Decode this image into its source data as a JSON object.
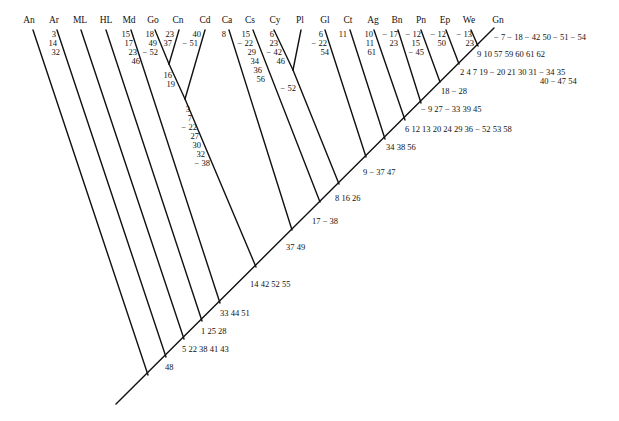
{
  "taxa": [
    {
      "label": "An",
      "x": 33
    },
    {
      "label": "Ar",
      "x": 57
    },
    {
      "label": "ML",
      "x": 81
    },
    {
      "label": "HL",
      "x": 106
    },
    {
      "label": "Md",
      "x": 131
    },
    {
      "label": "Go",
      "x": 155
    },
    {
      "label": "Cn",
      "x": 179
    },
    {
      "label": "Cd",
      "x": 205
    },
    {
      "label": "Ca",
      "x": 229
    },
    {
      "label": "Cs",
      "x": 253
    },
    {
      "label": "Cy",
      "x": 274
    },
    {
      "label": "Pl",
      "x": 301
    },
    {
      "label": "Gl",
      "x": 325
    },
    {
      "label": "Ct",
      "x": 350
    },
    {
      "label": "Ag",
      "x": 374
    },
    {
      "label": "Bn",
      "x": 398
    },
    {
      "label": "Pn",
      "x": 421
    },
    {
      "label": "Ep",
      "x": 446
    },
    {
      "label": "We",
      "x": 471
    },
    {
      "label": "Gn",
      "x": 498
    }
  ],
  "terminal_characters": {
    "Ar": [
      "3",
      "14",
      "32"
    ],
    "Md": [
      "15",
      "17",
      "23",
      "46"
    ],
    "Go": [
      "18",
      "49",
      "− 52"
    ],
    "Cn": [
      "23",
      "37"
    ],
    "Cd": [
      "40",
      "− 51"
    ],
    "Ca": [
      "8"
    ],
    "Cs": [
      "15",
      "− 22",
      "29",
      "34",
      "36",
      "56"
    ],
    "Cy": [
      "6",
      "23",
      "− 42",
      "46"
    ],
    "Gl": [
      "6",
      "− 22",
      "54"
    ],
    "Ct": [
      "11"
    ],
    "Ag": [
      "10",
      "11",
      "61"
    ],
    "Bn": [
      "− 17",
      "23"
    ],
    "Pn": [
      "− 12",
      "15",
      "− 45"
    ],
    "Ep": [
      "− 12",
      "50"
    ],
    "We": [
      "− 13",
      "23"
    ],
    "Gn": [
      "− 7 − 18 − 42 50 − 51 − 54"
    ]
  },
  "internal_characters": {
    "go_cn": [
      "16",
      "19"
    ],
    "go_cn_cd": [
      "3",
      "7",
      "− 22",
      "27",
      "30",
      "32",
      "− 38"
    ],
    "cy_pl": [
      "− 52"
    ],
    "node_we_gn": "9 10 57 59 60 61 62",
    "node_ep": [
      "2 4 7 19 − 20 21 30 31 − 34 35",
      "40 − 47 54"
    ],
    "node_pn": "18 − 28",
    "node_bn": "− 9 27 − 33 39 45",
    "node_ag": "6 12 13 20 24 29 36 − 52 53 58",
    "node_ct": "34 38 56",
    "node_gl": "9 − 37 47",
    "node_cy": "8 16 26",
    "node_cs": "17 − 38",
    "node_ca": "37 49",
    "node_cd": "14 42 52 55",
    "node_md": "33 44 51",
    "node_hl": "1 25 28",
    "node_ml": "5 22 38 41 43",
    "node_ar": "48"
  }
}
